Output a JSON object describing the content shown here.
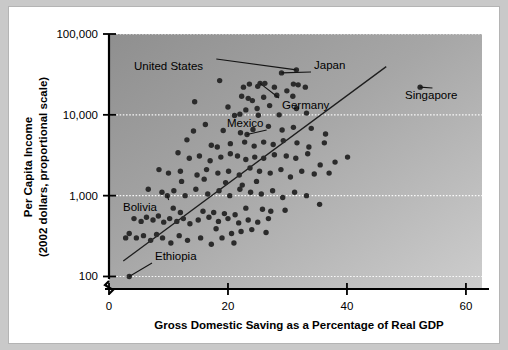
{
  "chart_data": {
    "type": "scatter",
    "title": "",
    "xlabel": "Gross Domestic Saving as a Percentage of Real GDP",
    "ylabel_line1": "Per Capita Income",
    "ylabel_line2": "(2002 dollars, proportional scale)",
    "yscale": "log",
    "xlim": [
      0,
      62.7
    ],
    "ylim": [
      70,
      100000
    ],
    "xticks": [
      0,
      20,
      40,
      60
    ],
    "xticklabels": [
      "0",
      "20",
      "40",
      "60"
    ],
    "yticks": [
      100,
      1000,
      10000,
      100000
    ],
    "yticklabels": [
      "100",
      "1,000",
      "10,000",
      "100,000"
    ],
    "grid": "horizontal-dotted-white",
    "legend": "none",
    "axis_break": true,
    "trendline": {
      "x0": 2.4,
      "y0": 155,
      "x1": 46.6,
      "y1": 39500
    },
    "annotations": [
      {
        "label": "United States",
        "text_x": 125,
        "text_y": 63,
        "point_x": 31.5,
        "point_y": 36000
      },
      {
        "label": "Japan",
        "text_x": 305,
        "text_y": 62,
        "point_x": 29.0,
        "point_y": 33000
      },
      {
        "label": "Germany",
        "text_x": 273,
        "text_y": 102,
        "point_x": 25.4,
        "point_y": 24500
      },
      {
        "label": "Mexico",
        "text_x": 218,
        "text_y": 120,
        "point_x": 23.2,
        "point_y": 5700
      },
      {
        "label": "Singapore",
        "text_x": 396,
        "text_y": 92,
        "point_x": 52.3,
        "point_y": 22000
      },
      {
        "label": "Bolivia",
        "text_x": 114,
        "text_y": 204,
        "point_x": 9.8,
        "point_y": 1000
      },
      {
        "label": "Ethiopia",
        "text_x": 146,
        "text_y": 253,
        "point_x": 3.4,
        "point_y": 100
      }
    ],
    "points": [
      [
        31.5,
        36000
      ],
      [
        29.0,
        33000
      ],
      [
        25.4,
        24500
      ],
      [
        52.3,
        22000
      ],
      [
        23.2,
        5700
      ],
      [
        2.8,
        300
      ],
      [
        3.4,
        100
      ],
      [
        9.8,
        1000
      ],
      [
        18.6,
        26500
      ],
      [
        22.6,
        22000
      ],
      [
        23.6,
        24000
      ],
      [
        25.0,
        22500
      ],
      [
        26.2,
        24500
      ],
      [
        27.8,
        22000
      ],
      [
        29.9,
        19800
      ],
      [
        31.0,
        24000
      ],
      [
        31.8,
        23500
      ],
      [
        33.0,
        22000
      ],
      [
        22.3,
        17000
      ],
      [
        23.4,
        16000
      ],
      [
        24.1,
        15000
      ],
      [
        26.0,
        16500
      ],
      [
        28.2,
        17500
      ],
      [
        30.9,
        17000
      ],
      [
        14.4,
        14500
      ],
      [
        20.0,
        12500
      ],
      [
        23.0,
        11500
      ],
      [
        24.9,
        12000
      ],
      [
        27.0,
        13000
      ],
      [
        31.5,
        12000
      ],
      [
        21.1,
        9800
      ],
      [
        22.0,
        10200
      ],
      [
        25.1,
        9900
      ],
      [
        28.6,
        10000
      ],
      [
        33.2,
        10500
      ],
      [
        16.2,
        7600
      ],
      [
        19.2,
        6400
      ],
      [
        22.1,
        6000
      ],
      [
        24.2,
        6600
      ],
      [
        26.8,
        7200
      ],
      [
        29.1,
        6500
      ],
      [
        31.0,
        7000
      ],
      [
        34.0,
        6800
      ],
      [
        36.4,
        5800
      ],
      [
        13.1,
        4900
      ],
      [
        17.2,
        4200
      ],
      [
        18.2,
        4000
      ],
      [
        20.4,
        4400
      ],
      [
        22.8,
        4600
      ],
      [
        24.4,
        4100
      ],
      [
        26.0,
        4600
      ],
      [
        27.6,
        4300
      ],
      [
        29.3,
        4800
      ],
      [
        31.6,
        4500
      ],
      [
        33.6,
        4000
      ],
      [
        36.2,
        4500
      ],
      [
        11.6,
        3400
      ],
      [
        13.5,
        2900
      ],
      [
        15.2,
        3100
      ],
      [
        17.0,
        2700
      ],
      [
        18.8,
        3000
      ],
      [
        20.4,
        3300
      ],
      [
        21.6,
        3100
      ],
      [
        23.0,
        2800
      ],
      [
        24.5,
        3000
      ],
      [
        26.0,
        2900
      ],
      [
        27.8,
        3200
      ],
      [
        29.8,
        3100
      ],
      [
        31.4,
        2900
      ],
      [
        33.4,
        3300
      ],
      [
        35.5,
        2400
      ],
      [
        38.0,
        2600
      ],
      [
        40.1,
        3000
      ],
      [
        8.4,
        2100
      ],
      [
        10.0,
        1900
      ],
      [
        12.0,
        2000
      ],
      [
        14.8,
        1800
      ],
      [
        16.4,
        2100
      ],
      [
        18.3,
        1900
      ],
      [
        20.1,
        2000
      ],
      [
        21.9,
        1800
      ],
      [
        23.7,
        2200
      ],
      [
        25.3,
        2000
      ],
      [
        27.1,
        1900
      ],
      [
        28.9,
        2100
      ],
      [
        30.5,
        1700
      ],
      [
        32.4,
        2000
      ],
      [
        34.5,
        1850
      ],
      [
        37.0,
        1900
      ],
      [
        6.6,
        1200
      ],
      [
        8.9,
        1100
      ],
      [
        10.9,
        1150
      ],
      [
        12.8,
        1000
      ],
      [
        14.6,
        1200
      ],
      [
        16.6,
        1050
      ],
      [
        18.5,
        1150
      ],
      [
        20.3,
        1000
      ],
      [
        22.0,
        1200
      ],
      [
        23.8,
        1100
      ],
      [
        25.6,
        1050
      ],
      [
        27.5,
        1150
      ],
      [
        29.2,
        950
      ],
      [
        31.2,
        1100
      ],
      [
        33.2,
        1000
      ],
      [
        35.4,
        780
      ],
      [
        4.2,
        520
      ],
      [
        5.4,
        480
      ],
      [
        6.3,
        540
      ],
      [
        7.4,
        500
      ],
      [
        8.3,
        560
      ],
      [
        9.2,
        470
      ],
      [
        10.2,
        520
      ],
      [
        11.4,
        480
      ],
      [
        12.5,
        520
      ],
      [
        13.6,
        450
      ],
      [
        15.0,
        500
      ],
      [
        16.8,
        540
      ],
      [
        18.4,
        480
      ],
      [
        20.0,
        520
      ],
      [
        21.8,
        460
      ],
      [
        23.4,
        500
      ],
      [
        25.0,
        470
      ],
      [
        26.8,
        520
      ],
      [
        3.4,
        340
      ],
      [
        4.6,
        300
      ],
      [
        5.8,
        320
      ],
      [
        7.0,
        280
      ],
      [
        8.0,
        330
      ],
      [
        9.0,
        300
      ],
      [
        10.4,
        260
      ],
      [
        11.8,
        320
      ],
      [
        13.2,
        280
      ],
      [
        15.4,
        300
      ],
      [
        17.2,
        250
      ],
      [
        19.0,
        300
      ],
      [
        21.0,
        260
      ],
      [
        14.2,
        6300
      ],
      [
        16.0,
        1600
      ],
      [
        12.2,
        1500
      ],
      [
        19.6,
        1450
      ],
      [
        22.4,
        1350
      ],
      [
        24.8,
        1500
      ],
      [
        12.0,
        620
      ],
      [
        10.8,
        700
      ],
      [
        23.0,
        700
      ],
      [
        25.8,
        680
      ],
      [
        27.2,
        640
      ],
      [
        29.6,
        660
      ],
      [
        21.2,
        580
      ],
      [
        19.4,
        600
      ],
      [
        17.6,
        620
      ],
      [
        15.8,
        640
      ],
      [
        26.4,
        350
      ],
      [
        24.0,
        380
      ],
      [
        22.2,
        360
      ],
      [
        20.6,
        340
      ],
      [
        18.0,
        390
      ]
    ]
  },
  "axis_titles": {
    "x": "Gross Domestic Saving as a Percentage of Real GDP",
    "y_line1": "Per Capita Income",
    "y_line2": "(2002 dollars, proportional scale)"
  }
}
